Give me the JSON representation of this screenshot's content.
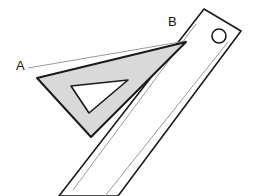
{
  "figure": {
    "canvas": {
      "width": 260,
      "height": 196,
      "background": "#ffffff"
    },
    "labels": [
      {
        "name": "point-label-a",
        "text": "A",
        "x": 16,
        "y": 70
      },
      {
        "name": "point-label-b",
        "text": "B",
        "x": 168,
        "y": 26
      }
    ],
    "line_ab": {
      "name": "line-segment-ab",
      "description": "thin straight pencil line drawn from A to B",
      "x1": 28,
      "y1": 68,
      "x2": 186,
      "y2": 41,
      "color": "#9a9a9a",
      "width": 1
    },
    "set_square": {
      "name": "set-square",
      "description": "shaded right triangle drafting set square with triangular cutout",
      "fill": "#d9d9d9",
      "stroke": "#1a1a1a",
      "stroke_width": 2,
      "outer_points": "37,78 186,42 91,137",
      "cutout": {
        "name": "set-square-cutout",
        "fill": "#ffffff",
        "stroke": "#1a1a1a",
        "stroke_width": 1.6,
        "points": "71,86 128,80 89,113"
      }
    },
    "ruler": {
      "name": "ruler",
      "description": "long straight edge with chamfered top end and a round hanging hole",
      "fill": "#ffffff",
      "stroke": "#1a1a1a",
      "stroke_width": 1.6,
      "body_points": "204,9 241,31 118,196 59,196",
      "inner_lines": [
        {
          "name": "ruler-inner-line-left",
          "x1": 196,
          "y1": 24,
          "x2": 73,
          "y2": 190,
          "color": "#9a9a9a",
          "width": 1
        },
        {
          "name": "ruler-inner-line-right",
          "x1": 228,
          "y1": 42,
          "x2": 105,
          "y2": 196,
          "color": "#9a9a9a",
          "width": 1
        }
      ],
      "hole": {
        "name": "ruler-hanging-hole",
        "cx": 219,
        "cy": 36,
        "r": 7,
        "fill": "#ffffff",
        "stroke": "#1a1a1a",
        "stroke_width": 1.6
      }
    },
    "colors": {
      "ink": "#1a1a1a",
      "light_ink": "#9a9a9a",
      "shade": "#d9d9d9",
      "paper": "#ffffff"
    }
  }
}
